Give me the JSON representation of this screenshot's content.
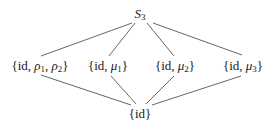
{
  "diagram": {
    "type": "subgroup-lattice",
    "top": {
      "base": "S",
      "sub": "3"
    },
    "middle": [
      {
        "id": "rho",
        "prefix": "{id, ",
        "parts": [
          {
            "sym": "ρ",
            "sub": "1"
          },
          {
            "sym": "ρ",
            "sub": "2"
          }
        ],
        "suffix": "}"
      },
      {
        "id": "mu1",
        "prefix": "{id, ",
        "parts": [
          {
            "sym": "μ",
            "sub": "1"
          }
        ],
        "suffix": "}"
      },
      {
        "id": "mu2",
        "prefix": "{id, ",
        "parts": [
          {
            "sym": "μ",
            "sub": "2"
          }
        ],
        "suffix": "}"
      },
      {
        "id": "mu3",
        "prefix": "{id, ",
        "parts": [
          {
            "sym": "μ",
            "sub": "3"
          }
        ],
        "suffix": "}"
      }
    ],
    "bottom": {
      "label": "{id}"
    },
    "edge_color": "#555555",
    "edges": [
      [
        "S3",
        "{id, ρ1, ρ2}"
      ],
      [
        "S3",
        "{id, μ1}"
      ],
      [
        "S3",
        "{id, μ2}"
      ],
      [
        "S3",
        "{id, μ3}"
      ],
      [
        "{id, ρ1, ρ2}",
        "{id}"
      ],
      [
        "{id, μ1}",
        "{id}"
      ],
      [
        "{id, μ2}",
        "{id}"
      ],
      [
        "{id, μ3}",
        "{id}"
      ]
    ]
  },
  "labels": {
    "top_base": "S",
    "top_sub": "3",
    "open": "{id, ",
    "close": "}",
    "comma": ", ",
    "rho": "ρ",
    "mu": "μ",
    "s1": "1",
    "s2": "2",
    "s3": "3",
    "bottom": "{id}"
  }
}
